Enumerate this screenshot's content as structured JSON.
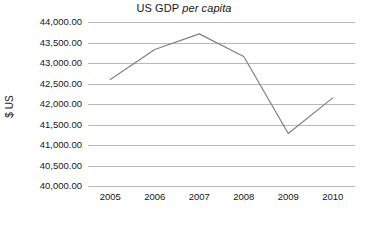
{
  "chart_data": {
    "type": "line",
    "title": "US GDP per capita",
    "title_parts": {
      "main": "US GDP",
      "emphasis": "per capita"
    },
    "xlabel": "",
    "ylabel": "$ US",
    "categories": [
      "2005",
      "2006",
      "2007",
      "2008",
      "2009",
      "2010"
    ],
    "values": [
      42600,
      43330,
      43710,
      43160,
      41280,
      42150
    ],
    "series": [
      {
        "name": "US GDP per capita",
        "values": [
          42600,
          43330,
          43710,
          43160,
          41280,
          42150
        ]
      }
    ],
    "ylim": [
      40000,
      44000
    ],
    "ytick_step": 500,
    "ytick_labels": [
      "44,000.00",
      "43,500.00",
      "43,000.00",
      "42,500.00",
      "42,000.00",
      "41,500.00",
      "41,000.00",
      "40,500.00",
      "40,000.00"
    ],
    "ytick_values": [
      44000,
      43500,
      43000,
      42500,
      42000,
      41500,
      41000,
      40500,
      40000
    ],
    "grid": true,
    "grid_axis": "y",
    "legend": false,
    "legend_position": "none",
    "markers": false,
    "colors": {
      "line": "#808080",
      "grid": "#b9b9b9",
      "text": "#161616",
      "background": "#ffffff"
    },
    "line_width": 1.2
  }
}
